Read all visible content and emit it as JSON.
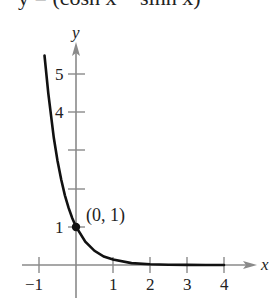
{
  "header_clipped": "y = (cosh x − sinh x)",
  "chart_data": {
    "type": "line",
    "title": "",
    "function": "y = e^(-2x)",
    "xlabel": "x",
    "ylabel": "y",
    "xlim": [
      -1.5,
      4.8
    ],
    "ylim": [
      -0.5,
      5.9
    ],
    "x_ticks": [
      -1,
      1,
      2,
      3,
      4
    ],
    "x_tick_labels": [
      "−1",
      "1",
      "2",
      "3",
      "4"
    ],
    "y_ticks": [
      1,
      2,
      3,
      4,
      5
    ],
    "y_tick_labels": [
      "1",
      "",
      "",
      "4",
      "5"
    ],
    "grid": false,
    "series": [
      {
        "name": "curve",
        "x": [
          -0.85,
          -0.75,
          -0.6,
          -0.5,
          -0.4,
          -0.3,
          -0.2,
          -0.1,
          0,
          0.25,
          0.5,
          0.75,
          1,
          1.5,
          2,
          2.5,
          3,
          3.5,
          4
        ],
        "y": [
          5.47,
          4.48,
          3.32,
          2.72,
          2.23,
          1.82,
          1.49,
          1.22,
          1.0,
          0.61,
          0.37,
          0.22,
          0.14,
          0.05,
          0.02,
          0.007,
          0.002,
          0.001,
          0.0003
        ]
      }
    ],
    "annotations": [
      {
        "text": "(0, 1)",
        "x": 0,
        "y": 1,
        "marker": "filled-dot"
      }
    ]
  }
}
